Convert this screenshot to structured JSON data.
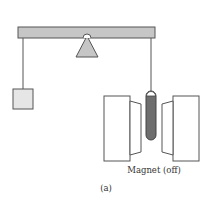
{
  "figure": {
    "label": "(a)",
    "magnet_label": "Magnet (off)",
    "components": {
      "beam": "balance-beam",
      "fulcrum": "triangular-pivot",
      "left_mass": "hanging-block",
      "right_sample": "sample-tube",
      "magnet": "electromagnet-pole-pieces"
    },
    "colors": {
      "beam_fill": "#c6c6c6",
      "fulcrum_fill": "#c6c6c6",
      "block_fill": "#e6e6e6",
      "tube_fill": "#6e6e6e",
      "stroke": "#555555",
      "magnet_fill": "#ffffff"
    }
  }
}
